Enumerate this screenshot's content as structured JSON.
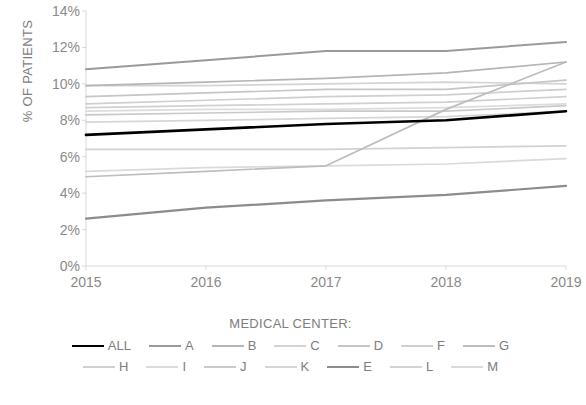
{
  "chart_data": {
    "type": "line",
    "title": "",
    "xlabel": "",
    "ylabel": "% OF PATIENTS",
    "legend_title": "MEDICAL CENTER:",
    "legend_position": "bottom",
    "grid": false,
    "x": [
      2015,
      2016,
      2017,
      2018,
      2019
    ],
    "xtick_labels": [
      "2015",
      "2016",
      "2017",
      "2018",
      "2019"
    ],
    "xlim": [
      2015,
      2019
    ],
    "ylim": [
      0,
      14
    ],
    "ytick_labels": [
      "0%",
      "2%",
      "4%",
      "6%",
      "8%",
      "10%",
      "12%",
      "14%"
    ],
    "ytick_values": [
      0,
      2,
      4,
      6,
      8,
      10,
      12,
      14
    ],
    "yunit": "%",
    "series": [
      {
        "name": "ALL",
        "color": "#000000",
        "width": 2.6,
        "values": [
          7.2,
          7.5,
          7.8,
          8.0,
          8.5
        ]
      },
      {
        "name": "A",
        "color": "#9a9a9a",
        "width": 2.0,
        "values": [
          10.8,
          11.3,
          11.8,
          11.8,
          12.3
        ]
      },
      {
        "name": "B",
        "color": "#b5b5b5",
        "width": 1.7,
        "values": [
          9.9,
          10.1,
          10.3,
          10.6,
          11.2
        ]
      },
      {
        "name": "C",
        "color": "#d4d4d4",
        "width": 1.7,
        "values": [
          9.9,
          9.9,
          10.0,
          10.1,
          10.0
        ]
      },
      {
        "name": "D",
        "color": "#c6c6c6",
        "width": 1.7,
        "values": [
          9.3,
          9.5,
          9.7,
          9.7,
          10.2
        ]
      },
      {
        "name": "F",
        "color": "#cfcfcf",
        "width": 1.7,
        "values": [
          8.9,
          9.1,
          9.3,
          9.4,
          9.7
        ]
      },
      {
        "name": "G",
        "color": "#bdbdbd",
        "width": 1.7,
        "values": [
          4.9,
          5.2,
          5.5,
          8.6,
          11.2
        ]
      },
      {
        "name": "H",
        "color": "#d0d0d0",
        "width": 1.7,
        "values": [
          8.7,
          8.8,
          8.9,
          9.0,
          9.3
        ]
      },
      {
        "name": "I",
        "color": "#dcdcdc",
        "width": 1.7,
        "values": [
          8.5,
          8.6,
          8.6,
          8.7,
          8.9
        ]
      },
      {
        "name": "J",
        "color": "#c9c9c9",
        "width": 1.7,
        "values": [
          8.3,
          8.4,
          8.5,
          8.5,
          8.8
        ]
      },
      {
        "name": "K",
        "color": "#d6d6d6",
        "width": 1.7,
        "values": [
          7.9,
          8.0,
          8.1,
          8.2,
          8.5
        ]
      },
      {
        "name": "E",
        "color": "#8c8c8c",
        "width": 2.2,
        "values": [
          2.6,
          3.2,
          3.6,
          3.9,
          4.4
        ]
      },
      {
        "name": "L",
        "color": "#d2d2d2",
        "width": 1.7,
        "values": [
          6.4,
          6.4,
          6.4,
          6.5,
          6.6
        ]
      },
      {
        "name": "M",
        "color": "#dadada",
        "width": 1.7,
        "values": [
          5.2,
          5.4,
          5.5,
          5.6,
          5.9
        ]
      }
    ]
  },
  "axis": {
    "y_title": "% OF PATIENTS"
  },
  "legend": {
    "title": "MEDICAL CENTER:",
    "rows": [
      [
        "ALL",
        "A",
        "B",
        "C",
        "D",
        "F",
        "G"
      ],
      [
        "H",
        "I",
        "J",
        "K",
        "E",
        "L",
        "M"
      ]
    ]
  }
}
